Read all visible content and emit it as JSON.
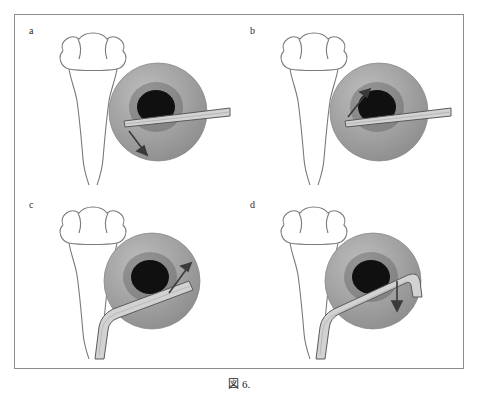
{
  "figure": {
    "caption_label": "図",
    "caption_number": "6.",
    "frame_color": "#8d8d8d",
    "background_color": "#ffffff"
  },
  "panels": [
    {
      "id": "a",
      "label": "a",
      "description": "Straight instrument entering eye from right, arrow pointing down-right at lower-left of pupil",
      "instrument": "straight-cannula",
      "arrow_direction": "down-right",
      "arrow_name": "arrow-down-right"
    },
    {
      "id": "b",
      "label": "b",
      "description": "Straight instrument entering eye from right, arrow pointing up-right at upper-left of pupil",
      "instrument": "straight-cannula",
      "arrow_direction": "up-right",
      "arrow_name": "arrow-up-right"
    },
    {
      "id": "c",
      "label": "c",
      "description": "Angled instrument entering eye from lower-left, arrow pointing up-right at upper-right of pupil",
      "instrument": "angled-cannula",
      "arrow_direction": "up-right",
      "arrow_name": "arrow-up-right"
    },
    {
      "id": "d",
      "label": "d",
      "description": "Angled hooked instrument entering eye from lower-left curving over the top, arrow pointing down at right of pupil",
      "instrument": "hooked-cannula",
      "arrow_direction": "down",
      "arrow_name": "arrow-down"
    }
  ],
  "anatomy": {
    "head_outline_color": "#7a7a7a",
    "eye_globe_color": "#9b9b9b",
    "eye_globe_highlight": "#b4b4b4",
    "pupil_color": "#111111",
    "instrument_fill": "#d0d0d0",
    "instrument_stroke": "#555555",
    "arrow_color": "#3a3a3a"
  }
}
